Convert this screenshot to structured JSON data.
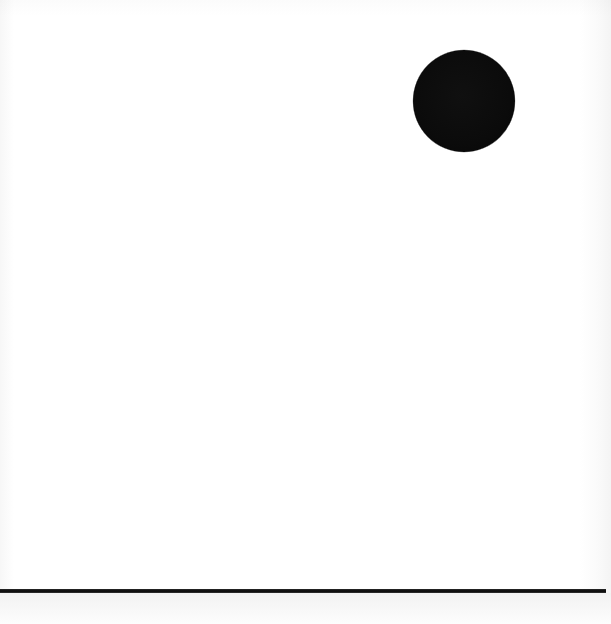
{
  "figure": {
    "title": "",
    "caption": "",
    "background_color": "#ffffff",
    "width_px": 611,
    "height_px": 624
  },
  "chart_data": {
    "type": "scatter",
    "title": "",
    "subtitle": "",
    "xlabel": "",
    "ylabel": "",
    "xlim": [
      0,
      611
    ],
    "ylim": [
      0,
      624
    ],
    "grid": false,
    "legend": [],
    "annotations": [],
    "tick_labels": {
      "x": [],
      "y": []
    },
    "series": [
      {
        "name": "point",
        "marker": "filled-circle",
        "color": "#0b0b0b",
        "marker_size_px": 102,
        "points": [
          {
            "x": 464,
            "y": 101
          }
        ]
      }
    ],
    "reference_lines": [
      {
        "name": "baseline",
        "orientation": "horizontal",
        "y": 591,
        "x_start": 0,
        "x_end": 606,
        "color": "#111111",
        "thickness_px": 4
      }
    ]
  },
  "elements": {
    "dot": {
      "name": "black-circle",
      "center_x": 464,
      "center_y": 101,
      "diameter": 102,
      "color": "#0b0b0b"
    },
    "rule": {
      "name": "horizontal-rule",
      "left": 0,
      "top": 589,
      "width": 606,
      "height": 4,
      "color": "#111111"
    },
    "shade": {
      "left": 0,
      "top": 593,
      "width": 611,
      "height": 31
    }
  }
}
